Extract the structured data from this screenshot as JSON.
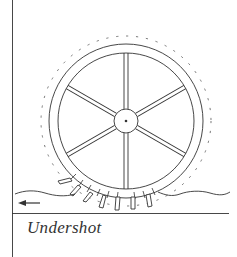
{
  "diagram": {
    "title": "Undershot",
    "elements": [
      "wheel-rim",
      "spokes",
      "hub",
      "paddles",
      "water-surface",
      "flow-arrow",
      "baseline"
    ],
    "spoke_count": 6,
    "flow_direction": "left",
    "colors": {
      "line": "#333333",
      "background": "#ffffff"
    }
  }
}
